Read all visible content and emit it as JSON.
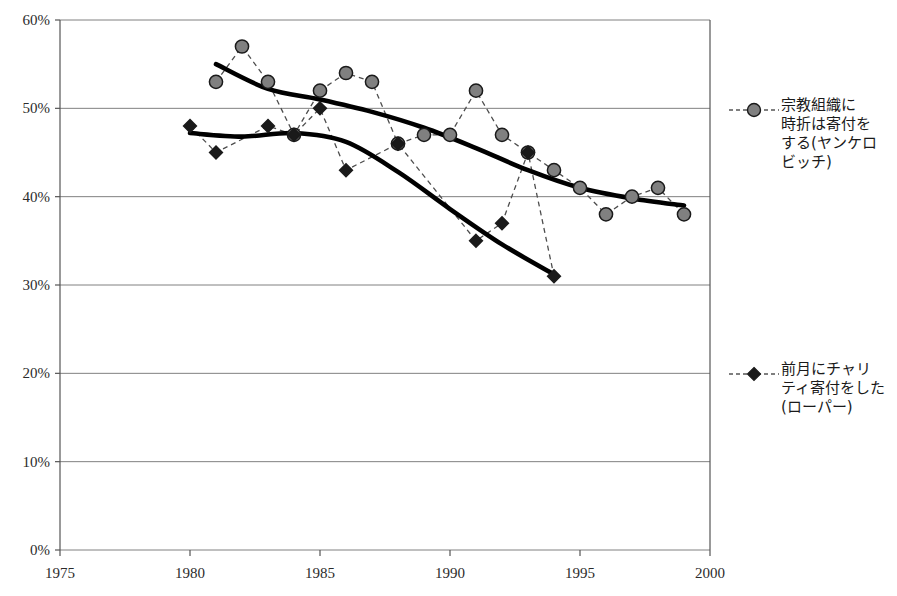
{
  "chart_data": {
    "type": "line",
    "title": "",
    "xlabel": "",
    "ylabel": "",
    "xlim": [
      1975,
      2000
    ],
    "ylim": [
      0,
      60
    ],
    "xticks": [
      "1975",
      "1980",
      "1985",
      "1990",
      "1995",
      "2000"
    ],
    "xtick_values": [
      1975,
      1980,
      1985,
      1990,
      1995,
      2000
    ],
    "yticks": [
      "0%",
      "10%",
      "20%",
      "30%",
      "40%",
      "50%",
      "60%"
    ],
    "ytick_values": [
      0,
      10,
      20,
      30,
      40,
      50,
      60
    ],
    "grid": true,
    "legend_position": "right",
    "series": [
      {
        "name": "宗教組織に時折は寄付をする(ヤンケロビッチ)",
        "marker": "circle",
        "marker_fill": "#808080",
        "marker_stroke": "#1a1a1a",
        "line_style": "dashed",
        "x": [
          1981,
          1982,
          1983,
          1984,
          1985,
          1986,
          1987,
          1988,
          1989,
          1990,
          1991,
          1992,
          1993,
          1994,
          1995,
          1996,
          1997,
          1998,
          1999
        ],
        "values": [
          53,
          57,
          53,
          47,
          52,
          54,
          53,
          46,
          47,
          47,
          52,
          47,
          45,
          43,
          41,
          38,
          40,
          41,
          38
        ],
        "trend": {
          "x": [
            1981,
            1983,
            1985,
            1987,
            1989,
            1991,
            1993,
            1995,
            1997,
            1999
          ],
          "values": [
            55.0,
            52.2,
            51.0,
            49.6,
            47.8,
            45.5,
            43.0,
            41.0,
            39.8,
            39.0
          ]
        }
      },
      {
        "name": "前月にチャリティ寄付をした(ローパー)",
        "marker": "diamond",
        "marker_fill": "#1a1a1a",
        "marker_stroke": "#1a1a1a",
        "line_style": "dashed",
        "x": [
          1980,
          1981,
          1983,
          1984,
          1985,
          1986,
          1988,
          1991,
          1992,
          1993,
          1994
        ],
        "values": [
          48,
          45,
          48,
          47,
          50,
          43,
          46,
          35,
          37,
          45,
          31
        ],
        "trend": {
          "x": [
            1980,
            1982,
            1984,
            1986,
            1988,
            1990,
            1992,
            1994
          ],
          "values": [
            47.2,
            46.8,
            47.2,
            46.2,
            42.8,
            38.6,
            34.6,
            31.2
          ]
        }
      }
    ]
  },
  "legend": {
    "entries": [
      {
        "marker": "circle-marker-icon",
        "label": "宗教組織に\n時折は寄付を\nする(ヤンケロ\nビッチ)"
      },
      {
        "marker": "diamond-marker-icon",
        "label": "前月にチャリ\nティ寄付をした\n(ローパー)"
      }
    ]
  },
  "colors": {
    "marker_gray": "#808080",
    "marker_dark": "#1a1a1a",
    "grid": "#808080",
    "axis": "#555555",
    "trend_line": "#000000"
  }
}
